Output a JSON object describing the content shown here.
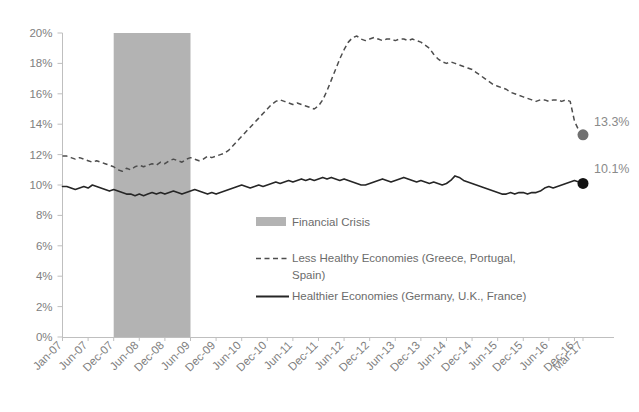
{
  "chart_data": {
    "type": "line",
    "title": "",
    "subtitle": "",
    "xlabel": "",
    "ylabel": "",
    "ylim": [
      0,
      20
    ],
    "ytick_labels": [
      "0%",
      "2%",
      "4%",
      "6%",
      "8%",
      "10%",
      "12%",
      "14%",
      "16%",
      "18%",
      "20%"
    ],
    "ytick_values": [
      0,
      2,
      4,
      6,
      8,
      10,
      12,
      14,
      16,
      18,
      20
    ],
    "xtick_labels": [
      "Jan-07",
      "Jun-07",
      "Dec-07",
      "Jun-08",
      "Dec-08",
      "Jun-09",
      "Dec-09",
      "Jun-10",
      "Dec-10",
      "Jun-11",
      "Dec-11",
      "Jun-12",
      "Dec-12",
      "Jun-13",
      "Dec-13",
      "Jun-14",
      "Dec-14",
      "Jun-15",
      "Dec-15",
      "Jun-16",
      "Dec-16",
      "Mar-17"
    ],
    "grid": false,
    "legend_position": "inside-center",
    "units": "percent",
    "x_start": "Jan-07",
    "x_end": "Mar-17",
    "x_interval": "monthly",
    "n_points": 123,
    "shaded_region": {
      "label": "Financial Crisis",
      "color": "#b3b3b3",
      "x_start": "Dec-07",
      "x_end": "Jun-09"
    },
    "series": [
      {
        "name": "Less Healthy Economies (Greece, Portugal, Spain)",
        "style": "dashed",
        "color": "#4d4d4d",
        "end_label": "13.3%",
        "end_value": 13.3,
        "marker_color": "#707070",
        "values": [
          11.9,
          11.9,
          11.8,
          11.7,
          11.8,
          11.7,
          11.6,
          11.5,
          11.6,
          11.5,
          11.4,
          11.3,
          11.2,
          11.0,
          10.9,
          11.1,
          11.0,
          11.2,
          11.3,
          11.2,
          11.3,
          11.4,
          11.3,
          11.5,
          11.4,
          11.6,
          11.7,
          11.6,
          11.5,
          11.7,
          11.8,
          11.7,
          11.6,
          11.7,
          11.9,
          11.8,
          11.9,
          12.0,
          12.1,
          12.3,
          12.6,
          12.9,
          13.2,
          13.5,
          13.8,
          14.1,
          14.4,
          14.7,
          15.0,
          15.3,
          15.5,
          15.6,
          15.5,
          15.4,
          15.3,
          15.4,
          15.3,
          15.2,
          15.1,
          15.0,
          15.2,
          15.6,
          16.2,
          16.9,
          17.6,
          18.3,
          18.9,
          19.4,
          19.7,
          19.8,
          19.6,
          19.5,
          19.6,
          19.7,
          19.6,
          19.5,
          19.6,
          19.6,
          19.5,
          19.6,
          19.6,
          19.5,
          19.6,
          19.5,
          19.4,
          19.2,
          19.0,
          18.6,
          18.3,
          18.1,
          18.0,
          18.1,
          18.0,
          17.9,
          17.8,
          17.7,
          17.6,
          17.4,
          17.2,
          17.0,
          16.8,
          16.6,
          16.5,
          16.4,
          16.3,
          16.1,
          16.0,
          15.9,
          15.8,
          15.7,
          15.6,
          15.5,
          15.6,
          15.6,
          15.5,
          15.6,
          15.6,
          15.5,
          15.6,
          15.5,
          14.2,
          13.6,
          13.3
        ]
      },
      {
        "name": "Healthier Economies (Germany, U.K., France)",
        "style": "solid",
        "color": "#262626",
        "end_label": "10.1%",
        "end_value": 10.1,
        "marker_color": "#121212",
        "values": [
          9.9,
          9.9,
          9.8,
          9.7,
          9.8,
          9.9,
          9.8,
          10.0,
          9.9,
          9.8,
          9.7,
          9.6,
          9.7,
          9.6,
          9.5,
          9.4,
          9.4,
          9.3,
          9.4,
          9.3,
          9.4,
          9.5,
          9.4,
          9.5,
          9.4,
          9.5,
          9.6,
          9.5,
          9.4,
          9.5,
          9.6,
          9.7,
          9.6,
          9.5,
          9.4,
          9.5,
          9.4,
          9.5,
          9.6,
          9.7,
          9.8,
          9.9,
          10.0,
          9.9,
          9.8,
          9.9,
          10.0,
          9.9,
          10.0,
          10.1,
          10.2,
          10.1,
          10.2,
          10.3,
          10.2,
          10.3,
          10.4,
          10.3,
          10.4,
          10.3,
          10.4,
          10.5,
          10.4,
          10.5,
          10.4,
          10.3,
          10.4,
          10.3,
          10.2,
          10.1,
          10.0,
          10.0,
          10.1,
          10.2,
          10.3,
          10.4,
          10.3,
          10.2,
          10.3,
          10.4,
          10.5,
          10.4,
          10.3,
          10.2,
          10.3,
          10.2,
          10.1,
          10.2,
          10.1,
          10.0,
          10.1,
          10.3,
          10.6,
          10.5,
          10.3,
          10.2,
          10.1,
          10.0,
          9.9,
          9.8,
          9.7,
          9.6,
          9.5,
          9.4,
          9.4,
          9.5,
          9.4,
          9.5,
          9.5,
          9.4,
          9.5,
          9.5,
          9.6,
          9.8,
          9.9,
          9.8,
          9.9,
          10.0,
          10.1,
          10.2,
          10.3,
          10.2,
          10.1
        ]
      }
    ]
  },
  "legend": {
    "items": [
      {
        "label": "Financial Crisis",
        "type": "band"
      },
      {
        "label": "Less Healthy Economies (Greece, Portugal,",
        "label_line2": "Spain)",
        "type": "dashed"
      },
      {
        "label": "Healthier Economies (Germany, U.K., France)",
        "type": "solid"
      }
    ]
  },
  "annotations": {
    "dashed_end": "13.3%",
    "solid_end": "10.1%"
  },
  "colors": {
    "band": "#b3b3b3",
    "dashed_series": "#4d4d4d",
    "solid_series": "#262626",
    "axis": "#bfbfbf",
    "tick_text": "#808080",
    "legend_text": "#6b6b6b",
    "label_text": "#8a8a8a"
  }
}
